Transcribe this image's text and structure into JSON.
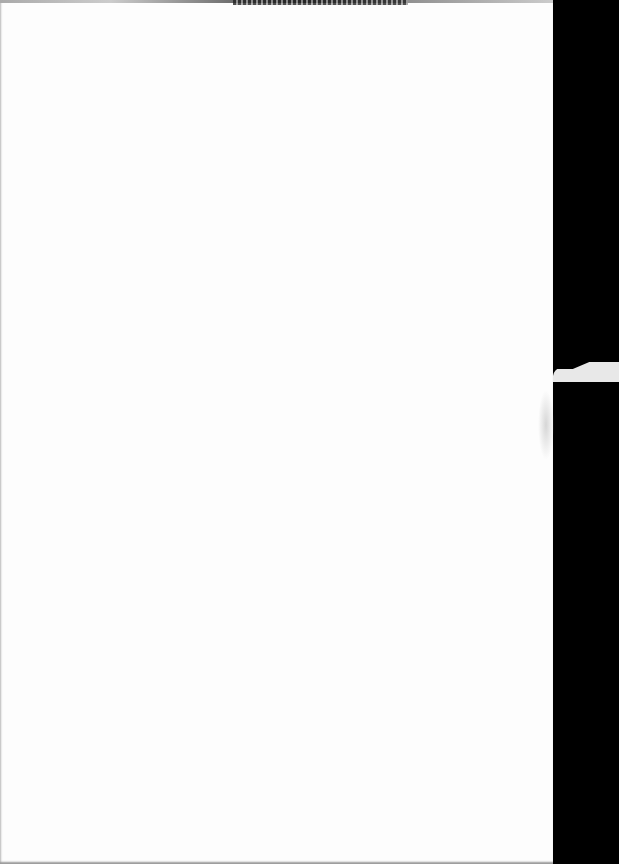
{
  "document": {
    "type": "scanned-page",
    "content": "",
    "header_text_illegible": true
  },
  "colors": {
    "page": "#fdfdfd",
    "background": "#000000"
  }
}
